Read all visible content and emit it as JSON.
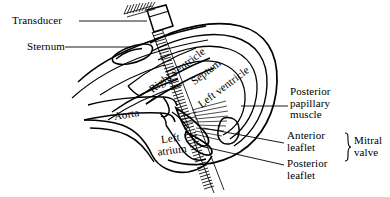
{
  "figure": {
    "type": "anatomical-line-diagram",
    "background_color": "#ffffff",
    "line_color": "#000000",
    "text_color": "#000000",
    "width": 390,
    "height": 197
  },
  "labels": {
    "transducer": "Transducer",
    "sternum": "Sternum",
    "right_ventricle": "Right ventricle",
    "septum": "Septum",
    "left_ventricle": "Left ventricle",
    "aorta": "Aorta",
    "left_atrium_line1": "Left",
    "left_atrium_line2": "atrium",
    "posterior_papillary_line1": "Posterior",
    "posterior_papillary_line2": "papillary",
    "posterior_papillary_line3": "muscle",
    "anterior_leaflet_line1": "Anterior",
    "anterior_leaflet_line2": "leaflet",
    "posterior_leaflet_line1": "Posterior",
    "posterior_leaflet_line2": "leaflet",
    "mitral_valve_line1": "Mitral",
    "mitral_valve_line2": "valve"
  },
  "parts": {
    "transducer_probe": "transducer-probe",
    "ultrasound_beam": "ultrasound-beam",
    "chest_wall": "chest-wall",
    "heart_outline": "heart-outline",
    "mitral_leaflets": "mitral-leaflets",
    "chordae_tendineae": "chordae-tendineae",
    "brace": "mitral-valve-brace"
  }
}
